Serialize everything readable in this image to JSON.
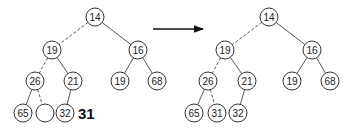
{
  "diagram": {
    "before": {
      "nodes": [
        {
          "id": "b14",
          "label": "14",
          "x": 95,
          "y": 17
        },
        {
          "id": "b19",
          "label": "19",
          "x": 52,
          "y": 50
        },
        {
          "id": "b16",
          "label": "16",
          "x": 138,
          "y": 50
        },
        {
          "id": "b26",
          "label": "26",
          "x": 35,
          "y": 81
        },
        {
          "id": "b21",
          "label": "21",
          "x": 73,
          "y": 81
        },
        {
          "id": "b19r",
          "label": "19",
          "x": 120,
          "y": 81
        },
        {
          "id": "b68",
          "label": "68",
          "x": 157,
          "y": 81
        },
        {
          "id": "b65",
          "label": "65",
          "x": 23,
          "y": 113
        },
        {
          "id": "bempty",
          "label": "",
          "x": 45,
          "y": 113
        },
        {
          "id": "b32",
          "label": "32",
          "x": 65,
          "y": 113
        }
      ],
      "edges": [
        {
          "from": "b14",
          "to": "b19",
          "dashed": true
        },
        {
          "from": "b14",
          "to": "b16",
          "dashed": false
        },
        {
          "from": "b19",
          "to": "b26",
          "dashed": true
        },
        {
          "from": "b19",
          "to": "b21",
          "dashed": false
        },
        {
          "from": "b16",
          "to": "b19r",
          "dashed": false
        },
        {
          "from": "b16",
          "to": "b68",
          "dashed": false
        },
        {
          "from": "b26",
          "to": "b65",
          "dashed": false
        },
        {
          "from": "b26",
          "to": "bempty",
          "dashed": true
        },
        {
          "from": "b21",
          "to": "b32",
          "dashed": false
        }
      ],
      "insert_value": "31"
    },
    "arrow": {
      "x1": 153,
      "y1": 29,
      "x2": 203,
      "y2": 29
    },
    "after": {
      "nodes": [
        {
          "id": "a14",
          "label": "14",
          "x": 269,
          "y": 17
        },
        {
          "id": "a19",
          "label": "19",
          "x": 225,
          "y": 50
        },
        {
          "id": "a16",
          "label": "16",
          "x": 312,
          "y": 50
        },
        {
          "id": "a26",
          "label": "26",
          "x": 208,
          "y": 81
        },
        {
          "id": "a21",
          "label": "21",
          "x": 247,
          "y": 81
        },
        {
          "id": "a19r",
          "label": "19",
          "x": 292,
          "y": 81
        },
        {
          "id": "a68",
          "label": "68",
          "x": 330,
          "y": 81
        },
        {
          "id": "a65",
          "label": "65",
          "x": 194,
          "y": 113
        },
        {
          "id": "a31",
          "label": "31",
          "x": 217,
          "y": 113
        },
        {
          "id": "a32",
          "label": "32",
          "x": 238,
          "y": 113
        }
      ],
      "edges": [
        {
          "from": "a14",
          "to": "a19",
          "dashed": true
        },
        {
          "from": "a14",
          "to": "a16",
          "dashed": false
        },
        {
          "from": "a19",
          "to": "a26",
          "dashed": true
        },
        {
          "from": "a19",
          "to": "a21",
          "dashed": false
        },
        {
          "from": "a16",
          "to": "a19r",
          "dashed": false
        },
        {
          "from": "a16",
          "to": "a68",
          "dashed": false
        },
        {
          "from": "a26",
          "to": "a65",
          "dashed": false
        },
        {
          "from": "a26",
          "to": "a31",
          "dashed": true
        },
        {
          "from": "a21",
          "to": "a32",
          "dashed": false
        }
      ]
    },
    "node_radius": 9,
    "colors": {
      "stroke": "#333333",
      "text": "#222222",
      "background": "#ffffff"
    }
  }
}
